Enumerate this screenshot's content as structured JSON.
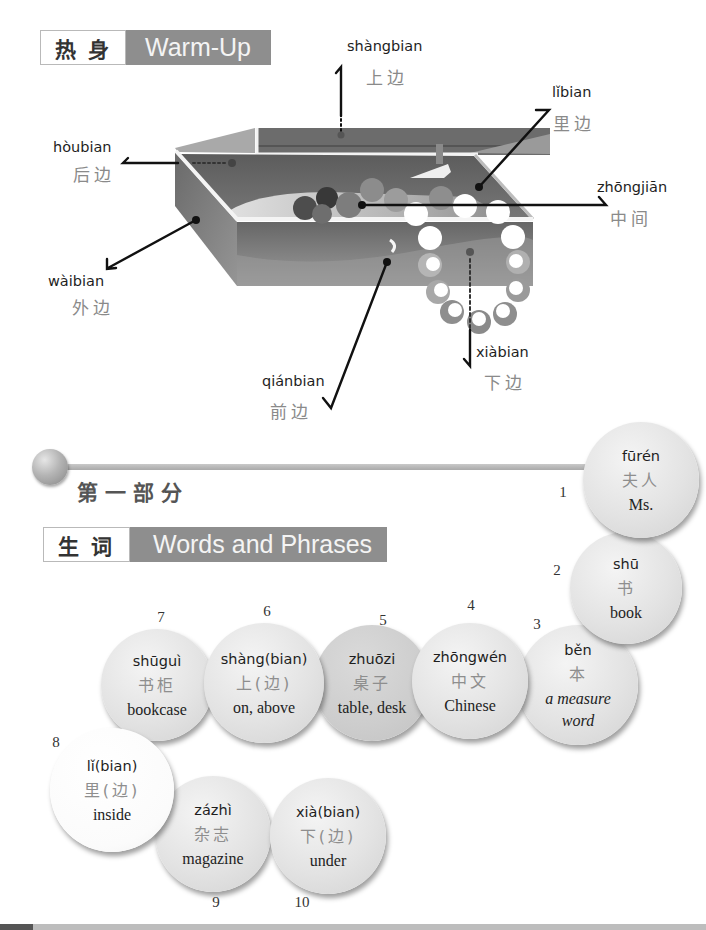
{
  "warmup_header": {
    "zh": "热身",
    "en": "Warm-Up"
  },
  "illustration": {
    "labels": {
      "shangbian": {
        "pinyin": "shàngbian",
        "hanzi": "上边"
      },
      "libian": {
        "pinyin": "lǐbian",
        "hanzi": "里边"
      },
      "houbian": {
        "pinyin": "hòubian",
        "hanzi": "后边"
      },
      "zhongjian": {
        "pinyin": "zhōngjiān",
        "hanzi": "中间"
      },
      "waibian": {
        "pinyin": "wàibian",
        "hanzi": "外边"
      },
      "qianbian": {
        "pinyin": "qiánbian",
        "hanzi": "前边"
      },
      "xiabian": {
        "pinyin": "xiàbian",
        "hanzi": "下边"
      }
    },
    "colors": {
      "box_dark": "#6a6a6a",
      "box_light": "#a0a0a0",
      "leader_line": "#111111"
    }
  },
  "section": {
    "title": "第一部分"
  },
  "vocab_header": {
    "zh": "生词",
    "en": "Words and Phrases"
  },
  "vocab": [
    {
      "num": "1",
      "pinyin": "fūrén",
      "hanzi": "夫人",
      "english": "Ms."
    },
    {
      "num": "2",
      "pinyin": "shū",
      "hanzi": "书",
      "english": "book"
    },
    {
      "num": "3",
      "pinyin": "běn",
      "hanzi": "本",
      "english": "a measure word"
    },
    {
      "num": "4",
      "pinyin": "zhōngwén",
      "hanzi": "中文",
      "english": "Chinese"
    },
    {
      "num": "5",
      "pinyin": "zhuōzi",
      "hanzi": "桌子",
      "english": "table, desk"
    },
    {
      "num": "6",
      "pinyin": "shàng(bian)",
      "hanzi": "上(边)",
      "english": "on, above"
    },
    {
      "num": "7",
      "pinyin": "shūguì",
      "hanzi": "书柜",
      "english": "bookcase"
    },
    {
      "num": "8",
      "pinyin": "lǐ(bian)",
      "hanzi": "里(边)",
      "english": "inside"
    },
    {
      "num": "9",
      "pinyin": "zázhì",
      "hanzi": "杂志",
      "english": "magazine"
    },
    {
      "num": "10",
      "pinyin": "xià(bian)",
      "hanzi": "下(边)",
      "english": "under"
    }
  ]
}
